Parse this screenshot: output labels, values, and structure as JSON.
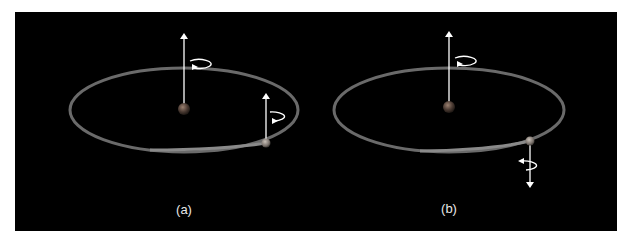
{
  "figure": {
    "background_color": "#000000",
    "orbit_color": "#6e6e6e",
    "arrow_color": "#ffffff",
    "panels": [
      {
        "id": "a",
        "label": "(a)",
        "star_spin": "up",
        "planet_spin": "up",
        "description": "Planet spin axis aligned with star spin axis"
      },
      {
        "id": "b",
        "label": "(b)",
        "star_spin": "up",
        "planet_spin": "down",
        "description": "Planet spin axis anti-aligned with star spin axis"
      }
    ]
  }
}
